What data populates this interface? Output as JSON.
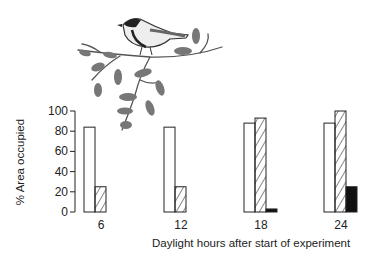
{
  "chart_data": {
    "type": "bar",
    "title": "",
    "xlabel": "Daylight hours after start of experiment",
    "ylabel": "% Area occupied",
    "ylim": [
      0,
      100
    ],
    "yticks": [
      0,
      20,
      40,
      60,
      80,
      100
    ],
    "categories": [
      "6",
      "12",
      "18",
      "24"
    ],
    "series": [
      {
        "name": "open",
        "pattern": "white",
        "values": [
          84,
          84,
          88,
          88
        ]
      },
      {
        "name": "hatched",
        "pattern": "diagonal-hatch",
        "values": [
          25,
          25,
          93,
          100
        ]
      },
      {
        "name": "solid",
        "pattern": "black",
        "values": [
          0,
          0,
          3,
          25
        ]
      }
    ],
    "grid": false,
    "legend": "none",
    "illustration": "bird (tit) perched on a leafy branch"
  }
}
